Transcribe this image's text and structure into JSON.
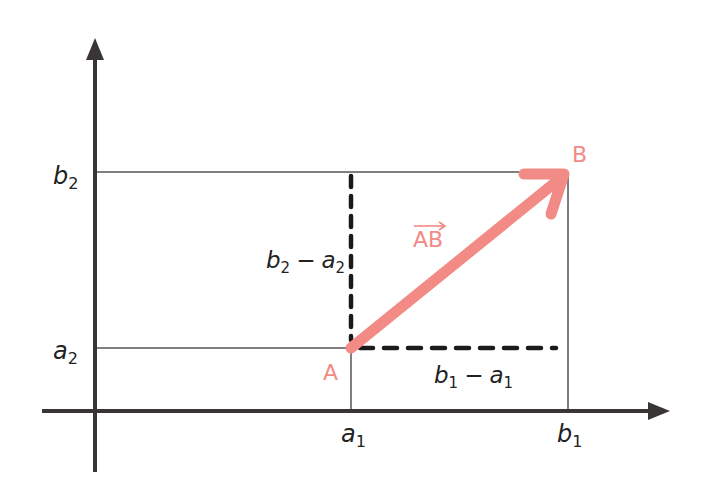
{
  "diagram": {
    "type": "vector-components",
    "colors": {
      "axis": "#3a3535",
      "grid": "#555555",
      "dashed": "#1a1a1a",
      "vector": "#f28a86",
      "text": "#222222"
    },
    "axes": {
      "x_ticks": [
        {
          "base": "a",
          "sub": "1"
        },
        {
          "base": "b",
          "sub": "1"
        }
      ],
      "y_ticks": [
        {
          "base": "b",
          "sub": "2"
        },
        {
          "base": "a",
          "sub": "2"
        }
      ]
    },
    "points": {
      "A": "A",
      "B": "B"
    },
    "vector_label": "AB",
    "vector_arrow_glyph": "→",
    "components": {
      "vertical": {
        "b": "b",
        "b_sub": "2",
        "minus": "−",
        "a": "a",
        "a_sub": "2"
      },
      "horizontal": {
        "b": "b",
        "b_sub": "1",
        "minus": "−",
        "a": "a",
        "a_sub": "1"
      }
    }
  }
}
